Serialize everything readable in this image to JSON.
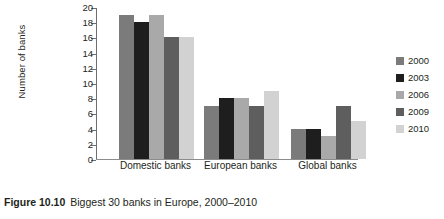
{
  "caption": {
    "figure_number": "Figure 10.10",
    "text": "Biggest 30 banks in Europe, 2000–2010"
  },
  "chart_data": {
    "type": "bar",
    "title": "",
    "subtitle": "",
    "xlabel": "",
    "ylabel": "Number of banks",
    "categories": [
      "Domestic banks",
      "European banks",
      "Global banks"
    ],
    "series": [
      {
        "name": "2000",
        "color": "#7b7b7b",
        "values": [
          19,
          7,
          4
        ]
      },
      {
        "name": "2003",
        "color": "#1e1e1e",
        "values": [
          18,
          8,
          4
        ]
      },
      {
        "name": "2006",
        "color": "#a9a9a9",
        "values": [
          19,
          8,
          3
        ]
      },
      {
        "name": "2009",
        "color": "#5e5e5e",
        "values": [
          16,
          7,
          7
        ]
      },
      {
        "name": "2010",
        "color": "#d2d2d2",
        "values": [
          16,
          9,
          5
        ]
      }
    ],
    "ylim": [
      0,
      20
    ],
    "ytick_step": 2,
    "yticks": [
      0,
      2,
      4,
      6,
      8,
      10,
      12,
      14,
      16,
      18,
      20
    ],
    "ytick_labels": [
      "0",
      "2",
      "4",
      "6",
      "8",
      "10",
      "12",
      "14",
      "16",
      "18",
      "20"
    ],
    "grid": false,
    "legend_position": "right",
    "legend_entries": [
      "2000",
      "2003",
      "2006",
      "2009",
      "2010"
    ]
  },
  "colors": {
    "axis": "#6d6e71",
    "baseline": "#8c8c8e",
    "text": "#231f20",
    "background": "#ffffff"
  }
}
